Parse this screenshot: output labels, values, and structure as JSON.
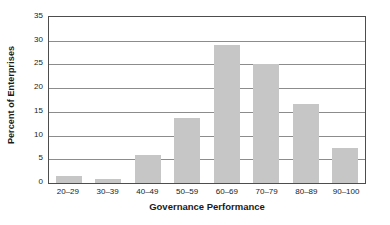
{
  "chart_data": {
    "type": "bar",
    "title": "",
    "xlabel": "Governance Performance",
    "ylabel": "Percent of Enterprises",
    "categories": [
      "20–29",
      "30–39",
      "40–49",
      "50–59",
      "60–69",
      "70–79",
      "80–89",
      "90–100"
    ],
    "values": [
      1.5,
      0.9,
      5.9,
      13.8,
      29.0,
      25.0,
      16.6,
      7.4
    ],
    "ylim": [
      0,
      35
    ],
    "ytick_values": [
      0,
      5,
      10,
      15,
      20,
      25,
      30,
      35
    ],
    "ytick_labels": [
      "0",
      "5",
      "10",
      "15",
      "20",
      "25",
      "30",
      "35"
    ],
    "grid": true,
    "grid_axis": "y",
    "legend": false,
    "legend_position": "none",
    "bar_color": "#c6c6c6",
    "axis_color": "#4d4d4d",
    "gridline_color": "#8c8c8c",
    "background_color": "#ffffff",
    "text_color": "#1a1a1a"
  }
}
